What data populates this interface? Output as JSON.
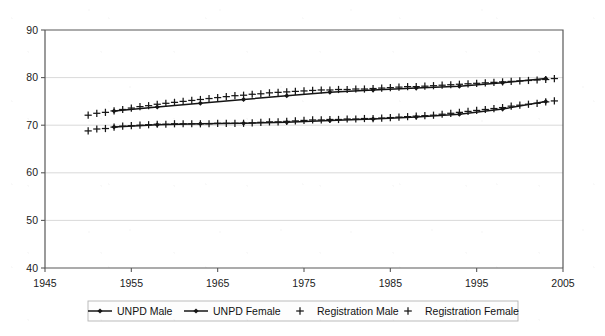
{
  "chart_data": {
    "type": "line",
    "title": "",
    "subtitle": "",
    "xlabel": "",
    "ylabel": "",
    "xlim": [
      1945,
      2005
    ],
    "ylim": [
      40,
      90
    ],
    "xticks": [
      1945,
      1955,
      1965,
      1975,
      1985,
      1995,
      2005
    ],
    "yticks": [
      40,
      50,
      60,
      70,
      80,
      90
    ],
    "xtick_labels": [
      "1945",
      "1955",
      "1965",
      "1975",
      "1985",
      "1995",
      "2005"
    ],
    "ytick_labels": [
      "40",
      "50",
      "60",
      "70",
      "80",
      "90"
    ],
    "grid": "horizontal",
    "legend_position": "bottom",
    "series": [
      {
        "name": "UNPD Male",
        "marker": "diamond",
        "line": "solid",
        "color": "#151515",
        "x": [
          1953,
          1958,
          1963,
          1968,
          1973,
          1978,
          1983,
          1988,
          1993,
          1998,
          2003
        ],
        "values": [
          69.6,
          70.1,
          70.3,
          70.4,
          70.6,
          71.0,
          71.3,
          71.7,
          72.3,
          73.4,
          75.0
        ]
      },
      {
        "name": "UNPD Female",
        "marker": "diamond",
        "line": "solid",
        "color": "#151515",
        "x": [
          1953,
          1958,
          1963,
          1968,
          1973,
          1978,
          1983,
          1988,
          1993,
          1998,
          2003
        ],
        "values": [
          73.0,
          73.8,
          74.6,
          75.4,
          76.2,
          76.9,
          77.4,
          77.8,
          78.2,
          78.9,
          79.8
        ]
      },
      {
        "name": "Registration Male",
        "marker": "plus",
        "line": "none",
        "color": "#171717",
        "x": [
          1950,
          1951,
          1952,
          1953,
          1954,
          1955,
          1956,
          1957,
          1958,
          1959,
          1960,
          1961,
          1962,
          1963,
          1964,
          1965,
          1966,
          1967,
          1968,
          1969,
          1970,
          1971,
          1972,
          1973,
          1974,
          1975,
          1976,
          1977,
          1978,
          1979,
          1980,
          1981,
          1982,
          1983,
          1984,
          1985,
          1986,
          1987,
          1988,
          1989,
          1990,
          1991,
          1992,
          1993,
          1994,
          1995,
          1996,
          1997,
          1998,
          1999,
          2000,
          2001,
          2002,
          2003,
          2004
        ],
        "values": [
          68.8,
          69.2,
          69.3,
          69.6,
          69.8,
          69.9,
          70.0,
          70.1,
          70.2,
          70.2,
          70.3,
          70.3,
          70.3,
          70.3,
          70.3,
          70.4,
          70.4,
          70.4,
          70.4,
          70.5,
          70.6,
          70.7,
          70.7,
          70.8,
          70.9,
          71.0,
          71.1,
          71.1,
          71.2,
          71.2,
          71.3,
          71.3,
          71.4,
          71.4,
          71.5,
          71.6,
          71.7,
          71.8,
          71.9,
          72.0,
          72.1,
          72.3,
          72.5,
          72.7,
          72.9,
          73.1,
          73.3,
          73.5,
          73.7,
          74.0,
          74.2,
          74.4,
          74.6,
          74.9,
          75.1
        ]
      },
      {
        "name": "Registration Female",
        "marker": "plus",
        "line": "none",
        "color": "#171717",
        "x": [
          1950,
          1951,
          1952,
          1953,
          1954,
          1955,
          1956,
          1957,
          1958,
          1959,
          1960,
          1961,
          1962,
          1963,
          1964,
          1965,
          1966,
          1967,
          1968,
          1969,
          1970,
          1971,
          1972,
          1973,
          1974,
          1975,
          1976,
          1977,
          1978,
          1979,
          1980,
          1981,
          1982,
          1983,
          1984,
          1985,
          1986,
          1987,
          1988,
          1989,
          1990,
          1991,
          1992,
          1993,
          1994,
          1995,
          1996,
          1997,
          1998,
          1999,
          2000,
          2001,
          2002,
          2003,
          2004
        ],
        "values": [
          72.1,
          72.5,
          72.7,
          73.0,
          73.3,
          73.6,
          73.9,
          74.1,
          74.4,
          74.6,
          74.8,
          75.0,
          75.2,
          75.4,
          75.6,
          75.8,
          76.0,
          76.2,
          76.3,
          76.5,
          76.6,
          76.8,
          76.9,
          77.0,
          77.1,
          77.2,
          77.3,
          77.4,
          77.4,
          77.5,
          77.5,
          77.6,
          77.6,
          77.7,
          77.8,
          77.9,
          78.0,
          78.1,
          78.1,
          78.2,
          78.3,
          78.4,
          78.5,
          78.6,
          78.7,
          78.8,
          78.9,
          79.0,
          79.1,
          79.2,
          79.3,
          79.4,
          79.5,
          79.6,
          79.8
        ]
      }
    ],
    "legend": [
      {
        "label": "UNPD Male",
        "marker": "diamond",
        "line": true
      },
      {
        "label": "UNPD Female",
        "marker": "diamond",
        "line": true
      },
      {
        "label": "Registration Male",
        "marker": "plus",
        "line": false
      },
      {
        "label": "Registration Female",
        "marker": "plus",
        "line": false
      }
    ],
    "colors": {
      "series": "#151515",
      "grid": "#cfcfcf",
      "axis": "#595959",
      "background": "#ffffff"
    }
  }
}
